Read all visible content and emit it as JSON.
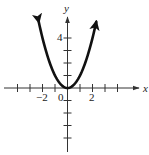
{
  "chart_data": {
    "type": "line",
    "title": "",
    "function": "y = x^2",
    "xlabel": "x",
    "ylabel": "y",
    "xlim": [
      -5,
      5.8
    ],
    "ylim": [
      -5.3,
      6.3
    ],
    "x_ticks": [
      -4,
      -3,
      -2,
      -1,
      1,
      2,
      3,
      4
    ],
    "y_ticks": [
      -4,
      -3,
      -2,
      -1,
      1,
      2,
      3,
      4
    ],
    "x_tick_labels": [
      {
        "value": -2,
        "label": "−2"
      },
      {
        "value": 2,
        "label": "2"
      }
    ],
    "y_tick_labels": [
      {
        "value": 4,
        "label": "4"
      }
    ],
    "origin_label": "0",
    "grid": false,
    "legend": null,
    "series": [
      {
        "name": "y = x^2",
        "x": [
          -2.3,
          -2,
          -1.5,
          -1,
          -0.5,
          0,
          0.5,
          1,
          1.5,
          2,
          2.3
        ],
        "y": [
          5.29,
          4,
          2.25,
          1,
          0.25,
          0,
          0.25,
          1,
          2.25,
          4,
          5.29
        ],
        "arrows_at_ends": true
      }
    ]
  },
  "labels": {
    "x_axis": "x",
    "y_axis": "y",
    "origin": "0",
    "x_neg2": "−2",
    "x_pos2": "2",
    "y_pos4": "4"
  },
  "colors": {
    "axis": "#333333",
    "curve": "#111111"
  }
}
